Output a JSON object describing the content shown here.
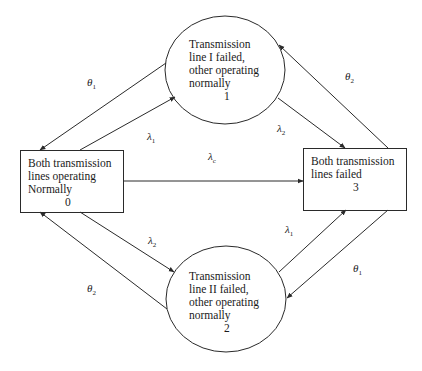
{
  "diagram": {
    "type": "state-transition",
    "nodes": [
      {
        "id": "0",
        "shape": "rect",
        "lines": [
          "Both transmission",
          "lines operating",
          "Normally"
        ],
        "number": "0"
      },
      {
        "id": "1",
        "shape": "ellipse",
        "lines": [
          "Transmission",
          "line I failed,",
          "other operating",
          "normally"
        ],
        "number": "1"
      },
      {
        "id": "2",
        "shape": "ellipse",
        "lines": [
          "Transmission",
          "line II failed,",
          "other operating",
          "normally"
        ],
        "number": "2"
      },
      {
        "id": "3",
        "shape": "rect",
        "lines": [
          "Both transmission",
          "lines failed"
        ],
        "number": "3"
      }
    ],
    "edges": [
      {
        "from": "1",
        "to": "0",
        "label_sym": "θ",
        "label_sub": "1"
      },
      {
        "from": "0",
        "to": "1",
        "label_sym": "λ",
        "label_sub": "1"
      },
      {
        "from": "1",
        "to": "3",
        "label_sym": "λ",
        "label_sub": "2"
      },
      {
        "from": "3",
        "to": "1",
        "label_sym": "θ",
        "label_sub": "2"
      },
      {
        "from": "0",
        "to": "3",
        "label_sym": "λ",
        "label_sub": "c"
      },
      {
        "from": "0",
        "to": "2",
        "label_sym": "λ",
        "label_sub": "2"
      },
      {
        "from": "2",
        "to": "0",
        "label_sym": "θ",
        "label_sub": "2"
      },
      {
        "from": "2",
        "to": "3",
        "label_sym": "λ",
        "label_sub": "1"
      },
      {
        "from": "3",
        "to": "2",
        "label_sym": "θ",
        "label_sub": "1"
      }
    ],
    "colors": {
      "stroke": "#2a2a2a",
      "text": "#1a1a1a",
      "background": "#ffffff"
    }
  }
}
